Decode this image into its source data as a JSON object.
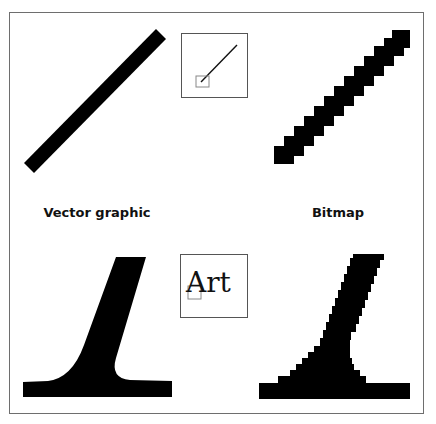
{
  "labels": {
    "vector": "Vector graphic",
    "bitmap": "Bitmap"
  },
  "inset_text": "Art",
  "colors": {
    "ink": "#000000",
    "frame": "#6e6e6e",
    "inset_border": "#555555",
    "zoom_marker": "#888888",
    "background": "#ffffff"
  },
  "panels": [
    {
      "position": "top-left",
      "content": "diagonal line rendered as vector"
    },
    {
      "position": "top-center",
      "content": "thumbnail of diagonal line with zoom marker"
    },
    {
      "position": "top-right",
      "content": "diagonal line rendered as bitmap (pixel staircase)"
    },
    {
      "position": "bottom-left",
      "content": "letter stem and serif rendered as vector"
    },
    {
      "position": "bottom-center",
      "content": "thumbnail of word with zoom marker"
    },
    {
      "position": "bottom-right",
      "content": "letter stem and serif rendered as bitmap"
    }
  ]
}
